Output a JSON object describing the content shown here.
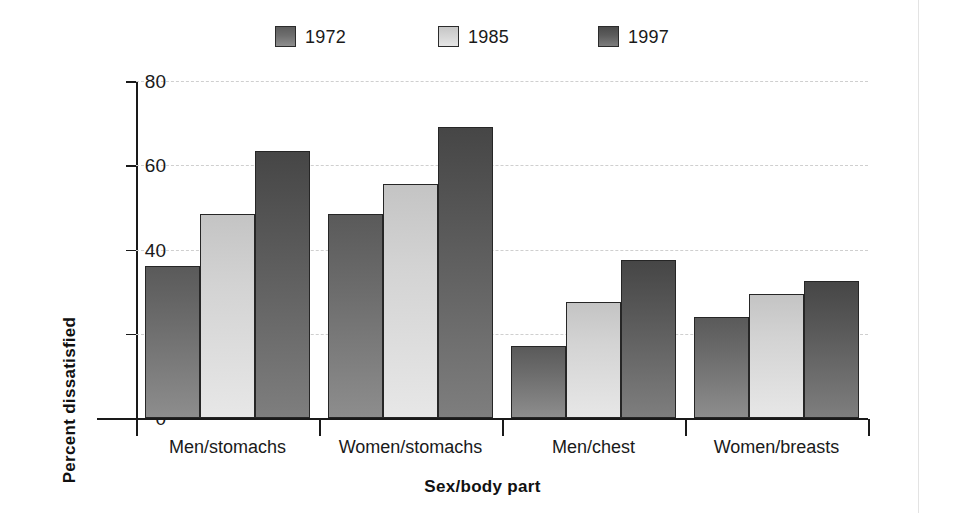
{
  "chart_data": {
    "type": "bar",
    "title": "",
    "xlabel": "Sex/body part",
    "ylabel": "Percent dissatisfied",
    "categories": [
      "Men/stomachs",
      "Women/stomachs",
      "Men/chest",
      "Women/breasts"
    ],
    "series": [
      {
        "name": "1972",
        "color": "#6b6b6b",
        "values": [
          36,
          48.5,
          17,
          24
        ]
      },
      {
        "name": "1985",
        "color": "#d3d3d3",
        "values": [
          48.5,
          55.5,
          27.5,
          29.5
        ]
      },
      {
        "name": "1997",
        "color": "#595959",
        "values": [
          63.5,
          69,
          37.5,
          32.5
        ]
      }
    ],
    "ylim": [
      0,
      80
    ],
    "yticks": [
      0,
      20,
      40,
      60,
      80
    ],
    "ytick_labels": [
      "0",
      "20",
      "40",
      "60",
      "80"
    ],
    "grid": "horizontal-dashed",
    "legend_position": "top-center",
    "legend_entries": [
      "1972",
      "1985",
      "1997"
    ]
  },
  "legend": {
    "items": [
      {
        "label": "1972",
        "swatch": "legend-swatch-1972"
      },
      {
        "label": "1985",
        "swatch": "legend-swatch-1985"
      },
      {
        "label": "1997",
        "swatch": "legend-swatch-1997"
      }
    ]
  },
  "axes": {
    "x_title": "Sex/body part",
    "y_title": "Percent dissatisfied"
  }
}
